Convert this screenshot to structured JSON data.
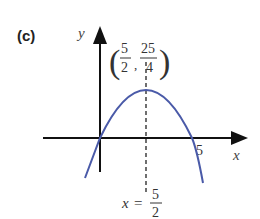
{
  "panel_label": "(c)",
  "axes": {
    "x_label": "x",
    "y_label": "y",
    "x_tick": "5"
  },
  "vertex": {
    "x_num": "5",
    "x_den": "2",
    "y_num": "25",
    "y_den": "4"
  },
  "symmetry_line": {
    "lhs": "x",
    "eq": "=",
    "num": "5",
    "den": "2"
  },
  "colors": {
    "curve": "#4a5aa8",
    "axes": "#111111",
    "text": "#222222"
  },
  "curve": {
    "type": "parabola",
    "equation": "y = x(5 - x)",
    "roots": [
      0,
      5
    ],
    "vertex": [
      2.5,
      6.25
    ]
  }
}
